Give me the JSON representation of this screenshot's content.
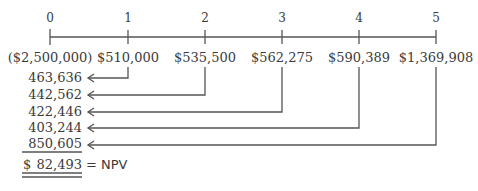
{
  "timeline": {
    "periods": [
      "0",
      "1",
      "2",
      "3",
      "4",
      "5"
    ],
    "cash_flows": [
      "($2,500,000)",
      "$510,000",
      "$535,500",
      "$562,275",
      "$590,389",
      "$1,369,908"
    ]
  },
  "present_values": [
    "463,636",
    "442,562",
    "422,446",
    "403,244",
    "850,605"
  ],
  "result": {
    "currency": "$",
    "value": "82,493",
    "label": "= NPV"
  },
  "colors": {
    "line": "#555555",
    "text": "#3a3a3a"
  }
}
